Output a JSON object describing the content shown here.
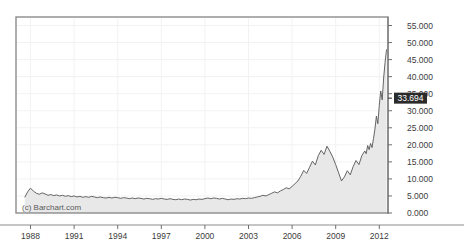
{
  "chart_data": {
    "type": "area",
    "title": "",
    "subtitle": "",
    "xlabel": "",
    "ylabel": "",
    "grid": true,
    "legend_position": "none",
    "xlim": [
      1987.0,
      2012.6
    ],
    "ylim": [
      0,
      57.5
    ],
    "yticks": [
      "0.000",
      "5.000",
      "10.000",
      "15.000",
      "20.000",
      "25.000",
      "30.000",
      "35.000",
      "40.000",
      "45.000",
      "50.000",
      "55.000"
    ],
    "ytick_values": [
      0,
      5,
      10,
      15,
      20,
      25,
      30,
      35,
      40,
      45,
      50,
      55
    ],
    "xticks": [
      "1988",
      "1991",
      "1994",
      "1997",
      "2000",
      "2003",
      "2006",
      "2009",
      "2012"
    ],
    "xtick_values": [
      1988,
      1991,
      1994,
      1997,
      2000,
      2003,
      2006,
      2009,
      2012
    ],
    "last_value_label": "33.694",
    "last_value": 33.694,
    "peak_value": 48.0,
    "min_value": 3.6,
    "line_color": "#555555",
    "fill_color": "#e8e8e8",
    "grid_color": "#f2f2f2",
    "frame_color": "#8c8c8c",
    "flag_color": "#2b2b2b",
    "watermark": "(c) Barchart.com",
    "x": [
      1987.6,
      1987.8,
      1988.0,
      1988.2,
      1988.4,
      1988.6,
      1988.8,
      1989.0,
      1989.2,
      1989.4,
      1989.6,
      1989.8,
      1990.0,
      1990.2,
      1990.4,
      1990.6,
      1990.8,
      1991.0,
      1991.2,
      1991.4,
      1991.6,
      1991.8,
      1992.0,
      1992.2,
      1992.4,
      1992.6,
      1992.8,
      1993.0,
      1993.2,
      1993.4,
      1993.6,
      1993.8,
      1994.0,
      1994.2,
      1994.4,
      1994.6,
      1994.8,
      1995.0,
      1995.2,
      1995.4,
      1995.6,
      1995.8,
      1996.0,
      1996.2,
      1996.4,
      1996.6,
      1996.8,
      1997.0,
      1997.2,
      1997.4,
      1997.6,
      1997.8,
      1998.0,
      1998.2,
      1998.4,
      1998.6,
      1998.8,
      1999.0,
      1999.2,
      1999.4,
      1999.6,
      1999.8,
      2000.0,
      2000.2,
      2000.4,
      2000.6,
      2000.8,
      2001.0,
      2001.2,
      2001.4,
      2001.6,
      2001.8,
      2002.0,
      2002.2,
      2002.4,
      2002.6,
      2002.8,
      2003.0,
      2003.2,
      2003.4,
      2003.6,
      2003.8,
      2004.0,
      2004.2,
      2004.4,
      2004.6,
      2004.8,
      2005.0,
      2005.2,
      2005.4,
      2005.6,
      2005.8,
      2006.0,
      2006.2,
      2006.4,
      2006.6,
      2006.8,
      2007.0,
      2007.2,
      2007.4,
      2007.6,
      2007.8,
      2008.0,
      2008.2,
      2008.4,
      2008.6,
      2008.8,
      2009.0,
      2009.2,
      2009.4,
      2009.6,
      2009.8,
      2010.0,
      2010.2,
      2010.4,
      2010.6,
      2010.8,
      2011.0,
      2011.1,
      2011.2,
      2011.3,
      2011.4,
      2011.5,
      2011.6,
      2011.7,
      2011.8,
      2011.9,
      2012.0,
      2012.1,
      2012.2,
      2012.3,
      2012.4,
      2012.5
    ],
    "y": [
      4.6,
      6.2,
      7.3,
      6.4,
      5.8,
      5.5,
      5.9,
      5.6,
      5.2,
      5.4,
      5.1,
      5.3,
      5.0,
      5.2,
      4.9,
      5.1,
      4.8,
      5.0,
      4.7,
      4.9,
      4.6,
      4.8,
      4.6,
      4.9,
      4.7,
      4.5,
      4.7,
      4.5,
      4.4,
      4.6,
      4.4,
      4.6,
      4.5,
      4.3,
      4.5,
      4.4,
      4.2,
      4.4,
      4.2,
      4.4,
      4.3,
      4.1,
      4.3,
      4.2,
      4.0,
      4.2,
      4.1,
      4.3,
      4.1,
      4.0,
      4.2,
      4.0,
      3.9,
      4.1,
      3.9,
      4.1,
      4.0,
      3.8,
      4.0,
      3.9,
      4.1,
      4.0,
      4.2,
      4.4,
      4.2,
      4.4,
      4.3,
      4.1,
      4.3,
      4.1,
      3.9,
      4.1,
      4.0,
      4.2,
      4.1,
      4.3,
      4.2,
      4.4,
      4.3,
      4.5,
      4.7,
      4.9,
      5.2,
      5.0,
      5.4,
      5.8,
      6.2,
      5.9,
      6.5,
      6.9,
      7.4,
      7.1,
      7.8,
      8.6,
      9.4,
      10.8,
      12.5,
      11.6,
      13.4,
      15.2,
      14.1,
      16.8,
      18.4,
      17.2,
      19.6,
      18.1,
      16.4,
      14.2,
      11.8,
      9.4,
      10.6,
      12.4,
      11.2,
      13.6,
      15.4,
      14.2,
      16.8,
      18.2,
      17.4,
      19.8,
      18.6,
      20.4,
      19.2,
      21.8,
      24.6,
      28.4,
      26.2,
      31.5,
      35.8,
      33.2,
      39.6,
      44.2,
      48.0,
      42.5,
      38.2,
      41.6,
      36.4,
      33.694
    ]
  },
  "accessibility": {
    "chart_name": "historical-price-area-chart"
  }
}
